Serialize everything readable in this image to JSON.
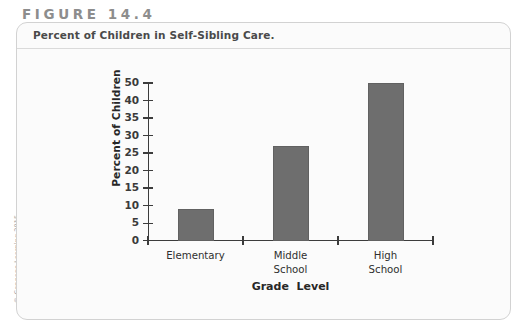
{
  "figure": {
    "label": "FIGURE 14.4",
    "caption": "Percent of Children in Self-Sibling Care.",
    "copyright": "© Cengage Learning 2015"
  },
  "colors": {
    "bar": "#6e6e6e",
    "axis": "#3c3c3c",
    "panel_border": "#d2d2d2",
    "figure_label": "#8d8d8d",
    "caption_text": "#4a4a4a"
  },
  "chart_data": {
    "type": "bar",
    "title": "Percent of Children in Self-Sibling Care.",
    "xlabel": "Grade  Level",
    "ylabel": "Percent of Children",
    "categories": [
      "Elementary",
      "Middle\nSchool",
      "High\nSchool"
    ],
    "values": [
      10,
      30,
      50
    ],
    "ylim": [
      0,
      50
    ],
    "ytick_values": [
      0,
      5,
      10,
      15,
      20,
      25,
      30,
      35,
      40,
      50
    ],
    "ytick_labels": [
      "0",
      "5",
      "10",
      "15",
      "20",
      "25",
      "30",
      "35",
      "40",
      "50"
    ],
    "grid": false,
    "legend": false
  }
}
